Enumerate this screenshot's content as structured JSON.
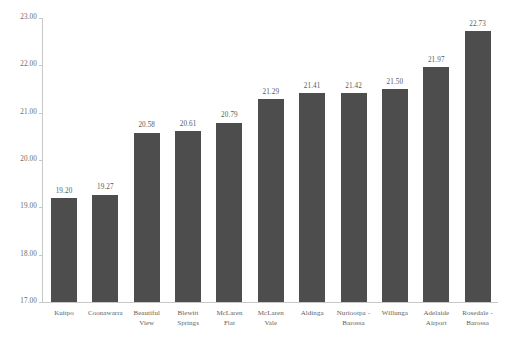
{
  "chart_data": {
    "type": "bar",
    "title": "",
    "subtitle": "",
    "xlabel": "",
    "ylabel": "",
    "ylim": [
      17.0,
      23.0
    ],
    "ytick_step": 1.0,
    "ytick_labels": [
      "23.00",
      "22.00",
      "21.00",
      "20.00",
      "19.00",
      "18.00",
      "17.00"
    ],
    "ytick_values": [
      23.0,
      22.0,
      21.0,
      20.0,
      19.0,
      18.0,
      17.0
    ],
    "grid": false,
    "legend": null,
    "bar_color": "#4d4d4d",
    "axis_color": "#c8c8c8",
    "value_labels_shown": true,
    "categories": [
      "Kuitpo",
      "Coonawarra",
      "Beautiful View",
      "Blewitt Springs",
      "McLaren Flat",
      "McLaren Vale",
      "Aldinga",
      "Nuriootpa - Barossa",
      "Willunga",
      "Adelaide Airport",
      "Rosedale - Barossa"
    ],
    "category_lines": [
      [
        "Kuitpo"
      ],
      [
        "Coonawarra"
      ],
      [
        "Beautiful",
        "View"
      ],
      [
        "Blewitt",
        "Springs"
      ],
      [
        "McLaren",
        "Flat"
      ],
      [
        "McLaren",
        "Vale"
      ],
      [
        "Aldinga"
      ],
      [
        "Nuriootpa -",
        "Barossa"
      ],
      [
        "Willunga"
      ],
      [
        "Adelaide",
        "Airport"
      ],
      [
        "Rosedale -",
        "Barossa"
      ]
    ],
    "values": [
      19.2,
      19.27,
      20.58,
      20.61,
      20.79,
      21.29,
      21.41,
      21.42,
      21.5,
      21.97,
      22.73
    ],
    "value_labels": [
      "19.20",
      "19.27",
      "20.58",
      "20.61",
      "20.79",
      "21.29",
      "21.41",
      "21.42",
      "21.50",
      "21.97",
      "22.73"
    ]
  }
}
